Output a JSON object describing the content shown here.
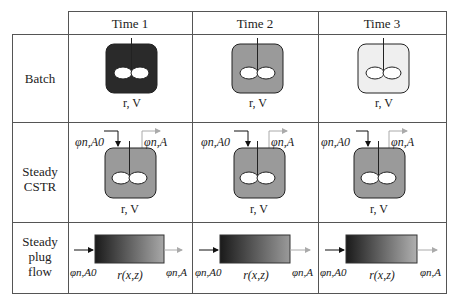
{
  "columns": [
    "Time 1",
    "Time 2",
    "Time 3"
  ],
  "rows": [
    {
      "label": "Batch"
    },
    {
      "label": "Steady\nCSTR",
      "label_lines": [
        "Steady",
        "CSTR"
      ]
    },
    {
      "label": "Steady plug flow",
      "label_lines": [
        "Steady",
        "plug",
        "flow"
      ]
    }
  ],
  "batch": {
    "caption": "r, V",
    "fill_colors": [
      "#2a2a2a",
      "#9a9a9a",
      "#efefef"
    ]
  },
  "cstr": {
    "caption": "r, V",
    "inlet_label": "φn,A0",
    "outlet_label": "φn,A",
    "fill_color": "#9a9a9a"
  },
  "pfr": {
    "caption": "r(x,z)",
    "inlet_label": "φn,A0",
    "outlet_label": "φn,A",
    "gradient_start": "#1a1a1a",
    "gradient_end": [
      "#a8a8a8",
      "#9a9a9a",
      "#b0b0b0"
    ]
  },
  "colors": {
    "grid": "#555555",
    "outlet_arrow": "#aaaaaa",
    "inlet_arrow": "#111111"
  }
}
